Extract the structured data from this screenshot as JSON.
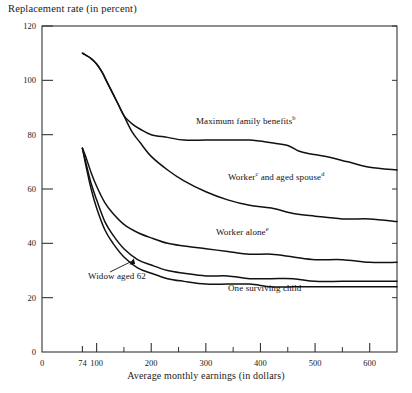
{
  "chart_data": {
    "type": "line",
    "title": "",
    "ylabel": "Replacement rate (in percent)",
    "xlabel": "Average monthly earnings (in dollars)",
    "xlim": [
      0,
      650
    ],
    "ylim": [
      0,
      120
    ],
    "ytick_labels": [
      "0",
      "20",
      "40",
      "60",
      "80",
      "100",
      "120"
    ],
    "ytick_values": [
      0,
      20,
      40,
      60,
      80,
      100,
      120
    ],
    "xtick_labels": [
      "0",
      "74",
      "100",
      "200",
      "300",
      "400",
      "500",
      "600"
    ],
    "xtick_values": [
      0,
      74,
      100,
      200,
      300,
      400,
      500,
      600
    ],
    "x_minor_ticks": [
      150,
      250,
      350,
      450,
      550,
      650
    ],
    "grid": false,
    "legend_position": "inline-annotations",
    "origin_label": "0",
    "series": [
      {
        "name": "Maximum family benefits",
        "footnote": "b",
        "label": "Maximum family benefits",
        "points": [
          [
            74,
            110
          ],
          [
            90,
            108
          ],
          [
            100,
            106
          ],
          [
            110,
            103
          ],
          [
            120,
            99
          ],
          [
            130,
            95
          ],
          [
            140,
            91
          ],
          [
            150,
            87
          ],
          [
            165,
            84
          ],
          [
            180,
            82
          ],
          [
            200,
            80
          ],
          [
            230,
            79
          ],
          [
            260,
            78
          ],
          [
            300,
            78
          ],
          [
            340,
            78
          ],
          [
            380,
            78
          ],
          [
            420,
            77
          ],
          [
            450,
            76
          ],
          [
            470,
            74
          ],
          [
            490,
            73
          ],
          [
            520,
            72
          ],
          [
            560,
            70
          ],
          [
            600,
            68
          ],
          [
            650,
            67
          ]
        ]
      },
      {
        "name": "Worker and aged spouse",
        "footnote_worker": "c",
        "footnote_spouse": "d",
        "label_part1": "Worker",
        "label_part2": " and aged spouse",
        "points": [
          [
            74,
            110
          ],
          [
            90,
            108
          ],
          [
            100,
            106
          ],
          [
            110,
            103
          ],
          [
            120,
            99
          ],
          [
            130,
            95
          ],
          [
            140,
            91
          ],
          [
            150,
            87
          ],
          [
            165,
            81
          ],
          [
            180,
            77
          ],
          [
            200,
            72
          ],
          [
            230,
            67
          ],
          [
            260,
            63
          ],
          [
            300,
            59
          ],
          [
            340,
            56
          ],
          [
            380,
            54
          ],
          [
            420,
            53
          ],
          [
            460,
            51
          ],
          [
            500,
            50
          ],
          [
            550,
            49
          ],
          [
            600,
            49
          ],
          [
            650,
            48
          ]
        ]
      },
      {
        "name": "Worker alone",
        "footnote": "e",
        "label": "Worker alone",
        "points": [
          [
            74,
            75
          ],
          [
            80,
            72
          ],
          [
            90,
            66
          ],
          [
            100,
            61
          ],
          [
            115,
            55
          ],
          [
            130,
            51
          ],
          [
            150,
            47
          ],
          [
            175,
            44
          ],
          [
            200,
            42
          ],
          [
            230,
            40
          ],
          [
            260,
            39
          ],
          [
            300,
            38
          ],
          [
            340,
            37
          ],
          [
            380,
            36
          ],
          [
            420,
            36
          ],
          [
            460,
            35
          ],
          [
            500,
            34
          ],
          [
            550,
            34
          ],
          [
            600,
            33
          ],
          [
            650,
            33
          ]
        ]
      },
      {
        "name": "Widow aged 62",
        "label": "Widow aged 62",
        "points": [
          [
            74,
            75
          ],
          [
            80,
            70
          ],
          [
            90,
            62
          ],
          [
            100,
            56
          ],
          [
            115,
            48
          ],
          [
            130,
            43
          ],
          [
            150,
            38
          ],
          [
            175,
            34
          ],
          [
            200,
            32
          ],
          [
            230,
            30
          ],
          [
            260,
            29
          ],
          [
            300,
            28
          ],
          [
            340,
            28
          ],
          [
            380,
            27
          ],
          [
            420,
            27
          ],
          [
            460,
            27
          ],
          [
            500,
            26
          ],
          [
            550,
            26
          ],
          [
            600,
            26
          ],
          [
            650,
            26
          ]
        ]
      },
      {
        "name": "One surviving child",
        "label": "One surviving child",
        "points": [
          [
            74,
            75
          ],
          [
            80,
            69
          ],
          [
            90,
            60
          ],
          [
            100,
            53
          ],
          [
            115,
            45
          ],
          [
            130,
            40
          ],
          [
            150,
            35
          ],
          [
            175,
            31
          ],
          [
            200,
            29
          ],
          [
            230,
            27
          ],
          [
            260,
            26
          ],
          [
            300,
            25
          ],
          [
            340,
            25
          ],
          [
            380,
            25
          ],
          [
            420,
            24
          ],
          [
            460,
            24
          ],
          [
            500,
            24
          ],
          [
            550,
            24
          ],
          [
            600,
            24
          ],
          [
            650,
            24
          ]
        ]
      }
    ],
    "annotations": [
      {
        "name": "widow-leader-line",
        "text": "Widow aged 62",
        "arrow": true
      }
    ],
    "line_color": "#111111",
    "axis_color": "#333333",
    "background": "#ffffff"
  }
}
